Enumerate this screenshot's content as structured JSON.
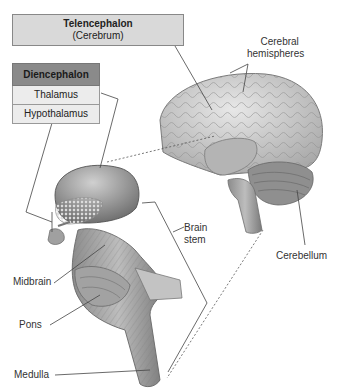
{
  "diagram": {
    "title_box": {
      "title": "Telencephalon",
      "subtitle": "(Cerebrum)"
    },
    "diencephalon_box": {
      "header": "Diencephalon",
      "rows": [
        "Thalamus",
        "Hypothalamus"
      ]
    },
    "labels": {
      "cerebral_hemispheres_1": "Cerebral",
      "cerebral_hemispheres_2": "hemispheres",
      "brain_stem_1": "Brain",
      "brain_stem_2": "stem",
      "cerebellum": "Cerebellum",
      "midbrain": "Midbrain",
      "pons": "Pons",
      "medulla": "Medulla"
    },
    "colors": {
      "header_fill": "#8a8a8a",
      "title_fill": "#d9d9d9",
      "row_fill": "#ececec",
      "tissue": "#9a9a9a"
    }
  }
}
